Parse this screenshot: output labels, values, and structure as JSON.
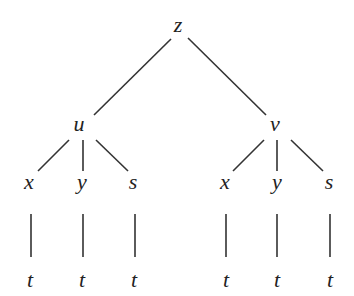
{
  "diagram": {
    "type": "tree",
    "root": {
      "id": "z",
      "label": "z"
    },
    "nodes": [
      {
        "id": "z",
        "label": "z",
        "x": 178,
        "y": 32
      },
      {
        "id": "u",
        "label": "u",
        "x": 79,
        "y": 131
      },
      {
        "id": "v",
        "label": "v",
        "x": 275,
        "y": 131
      },
      {
        "id": "ux",
        "label": "x",
        "x": 29,
        "y": 189
      },
      {
        "id": "uy",
        "label": "y",
        "x": 82,
        "y": 189
      },
      {
        "id": "us",
        "label": "s",
        "x": 133,
        "y": 189
      },
      {
        "id": "vx",
        "label": "x",
        "x": 225,
        "y": 189
      },
      {
        "id": "vy",
        "label": "y",
        "x": 277,
        "y": 189
      },
      {
        "id": "vs",
        "label": "s",
        "x": 329,
        "y": 189
      },
      {
        "id": "uxt",
        "label": "t",
        "x": 30,
        "y": 287
      },
      {
        "id": "uyt",
        "label": "t",
        "x": 82,
        "y": 287
      },
      {
        "id": "ust",
        "label": "t",
        "x": 134,
        "y": 287
      },
      {
        "id": "vxt",
        "label": "t",
        "x": 226,
        "y": 287
      },
      {
        "id": "vyt",
        "label": "t",
        "x": 277,
        "y": 287
      },
      {
        "id": "vst",
        "label": "t",
        "x": 330,
        "y": 287
      }
    ],
    "edges": [
      {
        "from": "z",
        "to": "u",
        "x1": 171,
        "y1": 39,
        "x2": 94,
        "y2": 115
      },
      {
        "from": "z",
        "to": "v",
        "x1": 188,
        "y1": 38,
        "x2": 266,
        "y2": 115
      },
      {
        "from": "u",
        "to": "ux",
        "x1": 69,
        "y1": 140,
        "x2": 38,
        "y2": 171
      },
      {
        "from": "u",
        "to": "uy",
        "x1": 83,
        "y1": 140,
        "x2": 83,
        "y2": 171
      },
      {
        "from": "u",
        "to": "us",
        "x1": 96,
        "y1": 140,
        "x2": 128,
        "y2": 171
      },
      {
        "from": "v",
        "to": "vx",
        "x1": 264,
        "y1": 140,
        "x2": 233,
        "y2": 171
      },
      {
        "from": "v",
        "to": "vy",
        "x1": 277,
        "y1": 140,
        "x2": 277,
        "y2": 171
      },
      {
        "from": "v",
        "to": "vs",
        "x1": 291,
        "y1": 140,
        "x2": 323,
        "y2": 171
      },
      {
        "from": "ux",
        "to": "uxt",
        "x1": 31,
        "y1": 214,
        "x2": 31,
        "y2": 257
      },
      {
        "from": "uy",
        "to": "uyt",
        "x1": 83,
        "y1": 214,
        "x2": 83,
        "y2": 257
      },
      {
        "from": "us",
        "to": "ust",
        "x1": 135,
        "y1": 214,
        "x2": 135,
        "y2": 257
      },
      {
        "from": "vx",
        "to": "vxt",
        "x1": 226,
        "y1": 214,
        "x2": 226,
        "y2": 257
      },
      {
        "from": "vy",
        "to": "vyt",
        "x1": 277,
        "y1": 214,
        "x2": 277,
        "y2": 257
      },
      {
        "from": "vs",
        "to": "vst",
        "x1": 330,
        "y1": 214,
        "x2": 330,
        "y2": 257
      }
    ]
  }
}
